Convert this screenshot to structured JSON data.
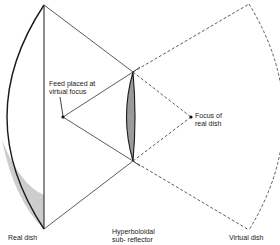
{
  "diagram": {
    "labels": {
      "feed_line1": "Feed placed at",
      "feed_line2": "virtual focus",
      "focus_line1": "Focus of",
      "focus_line2": "real dish",
      "real_dish": "Real dish",
      "sub_line1": "Hyperboloidal",
      "sub_line2": "sub- reflector",
      "virtual_dish": "Virtual dish"
    },
    "points": {
      "real_dish_top": [
        44,
        5
      ],
      "real_dish_bottom": [
        44,
        229
      ],
      "sub_reflector_top": [
        133,
        72
      ],
      "sub_reflector_bottom": [
        133,
        161
      ],
      "feed": [
        63,
        117
      ],
      "focus_real_dish": [
        191,
        117
      ],
      "virtual_dish_top": [
        249,
        4
      ],
      "virtual_dish_bottom": [
        249,
        230
      ]
    },
    "colors": {
      "line": "#1a1a1a",
      "hatch": "#555555",
      "background": "#ffffff"
    }
  }
}
